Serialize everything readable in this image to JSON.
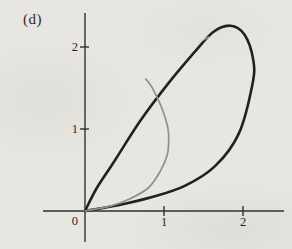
{
  "panel_label": "(d)",
  "figure": {
    "colors": {
      "background": "#eae8e3",
      "axis": "#2b2b2b",
      "text": "#1f1f1f",
      "loop_stroke": "#1c1c1c",
      "arc_stroke": "#8e8e8c"
    }
  },
  "chart_data": {
    "type": "line",
    "title": "",
    "xlabel": "",
    "ylabel": "",
    "xlim": [
      -0.55,
      2.55
    ],
    "ylim": [
      -0.45,
      2.45
    ],
    "grid": false,
    "origin_label": "0",
    "x_ticks": [
      {
        "value": 1,
        "label": "1"
      },
      {
        "value": 2,
        "label": "2"
      }
    ],
    "y_ticks": [
      {
        "value": 1,
        "label": "1"
      },
      {
        "value": 2,
        "label": "2"
      }
    ],
    "series": [
      {
        "name": "outer-loop",
        "color": "#1c1c1c",
        "stroke_px": 2.6,
        "closed_at_origin": true,
        "points": [
          [
            0,
            0
          ],
          [
            0.42,
            0.07
          ],
          [
            0.85,
            0.17
          ],
          [
            1.27,
            0.31
          ],
          [
            1.65,
            0.55
          ],
          [
            1.95,
            0.95
          ],
          [
            2.12,
            1.55
          ],
          [
            2.13,
            1.84
          ],
          [
            2.02,
            2.15
          ],
          [
            1.84,
            2.26
          ],
          [
            1.62,
            2.18
          ],
          [
            1.38,
            1.93
          ],
          [
            1.05,
            1.55
          ],
          [
            0.7,
            1.1
          ],
          [
            0.38,
            0.62
          ],
          [
            0.15,
            0.28
          ],
          [
            0,
            0
          ]
        ]
      },
      {
        "name": "inner-arc",
        "color": "#8e8e8c",
        "stroke_px": 1.7,
        "closed_at_origin": false,
        "points": [
          [
            0,
            0
          ],
          [
            0.32,
            0.06
          ],
          [
            0.57,
            0.15
          ],
          [
            0.8,
            0.28
          ],
          [
            0.95,
            0.48
          ],
          [
            1.04,
            0.68
          ],
          [
            1.06,
            0.84
          ],
          [
            1.05,
            1.01
          ],
          [
            0.99,
            1.21
          ],
          [
            0.92,
            1.37
          ],
          [
            0.84,
            1.52
          ],
          [
            0.77,
            1.61
          ]
        ]
      }
    ],
    "layout": {
      "origin_px": [
        85,
        211
      ],
      "px_per_unit": [
        79,
        82
      ],
      "x_axis_px": [
        43,
        284
      ],
      "y_axis_px": [
        13,
        242
      ],
      "tick_half_px": 5,
      "axis_stroke_px": 1.4,
      "tick_label_font_px": 12.5
    }
  }
}
